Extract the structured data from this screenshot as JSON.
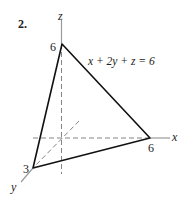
{
  "problem": {
    "number": "2."
  },
  "axes": {
    "x_label": "x",
    "y_label": "y",
    "z_label": "z",
    "axis_color": "#999999"
  },
  "intercepts": {
    "x": "6",
    "y": "3",
    "z": "6"
  },
  "plane": {
    "equation": "x + 2y + z = 6",
    "edge_color": "#111111"
  }
}
